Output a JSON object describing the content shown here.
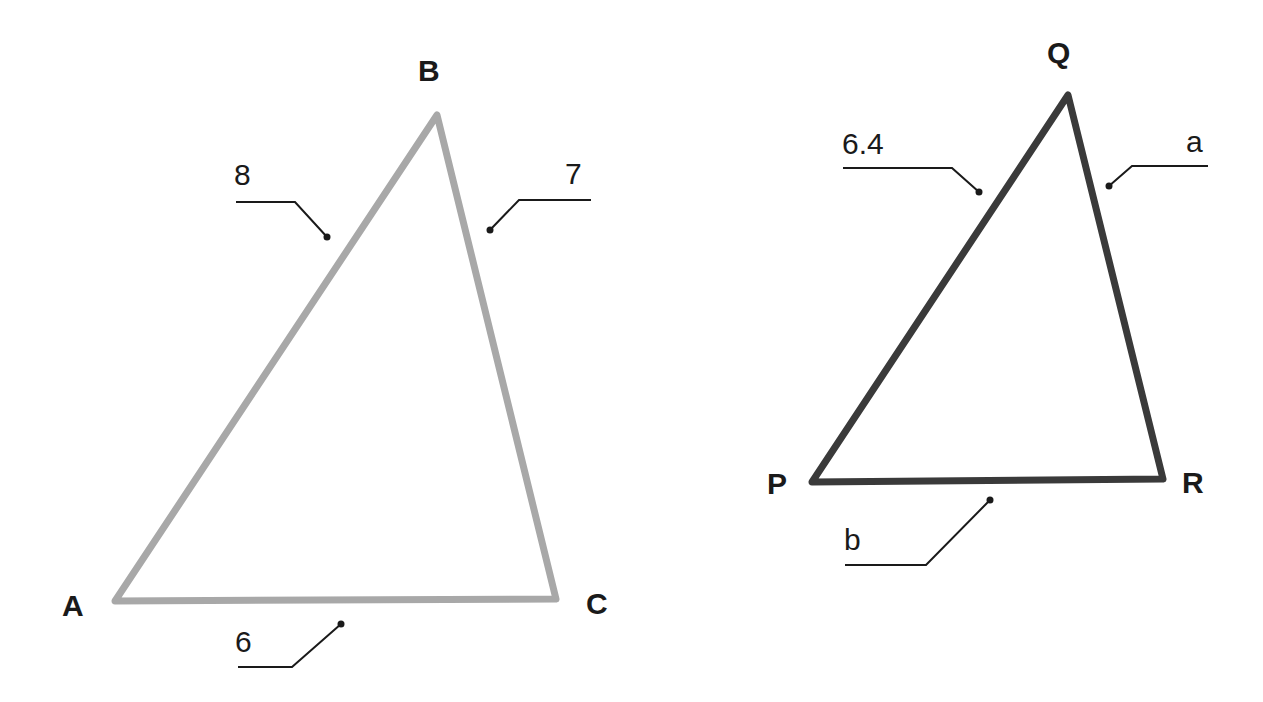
{
  "triangles": [
    {
      "name": "ABC",
      "stroke": "#a8a8a8",
      "vertices": [
        {
          "label": "A",
          "x": 115,
          "y": 601
        },
        {
          "label": "B",
          "x": 437,
          "y": 115
        },
        {
          "label": "C",
          "x": 556,
          "y": 599
        }
      ],
      "sides": [
        {
          "side": "AB",
          "label": "8"
        },
        {
          "side": "BC",
          "label": "7"
        },
        {
          "side": "AC",
          "label": "6"
        }
      ]
    },
    {
      "name": "PQR",
      "stroke": "#3a3a3a",
      "vertices": [
        {
          "label": "P",
          "x": 812,
          "y": 482
        },
        {
          "label": "Q",
          "x": 1068,
          "y": 95
        },
        {
          "label": "R",
          "x": 1163,
          "y": 479
        }
      ],
      "sides": [
        {
          "side": "PQ",
          "label": "6.4"
        },
        {
          "side": "QR",
          "label": "a"
        },
        {
          "side": "PR",
          "label": "b"
        }
      ]
    }
  ]
}
